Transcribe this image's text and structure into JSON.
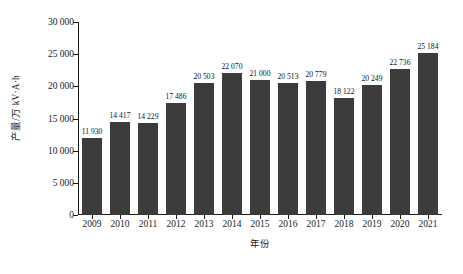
{
  "chart_data": {
    "type": "bar",
    "title": "",
    "subtitle": "",
    "xlabel": "年份",
    "ylabel": "产量/万 kV·A·h",
    "categories": [
      "2009",
      "2010",
      "2011",
      "2012",
      "2013",
      "2014",
      "2015",
      "2016",
      "2017",
      "2018",
      "2019",
      "2020",
      "2021"
    ],
    "values": [
      11930,
      14417,
      14229,
      17486,
      20503,
      22070,
      21000,
      20513,
      20779,
      18122,
      20249,
      22736,
      25184
    ],
    "value_labels": [
      "11 930",
      "14 417",
      "14 229",
      "17 486",
      "20 503",
      "22 070",
      "21 000",
      "20 513",
      "20 779",
      "18 122",
      "20 249",
      "22 736",
      "25 184"
    ],
    "ylim": [
      0,
      30000
    ],
    "ytick_values": [
      0,
      5000,
      10000,
      15000,
      20000,
      25000,
      30000
    ],
    "ytick_labels": [
      "0",
      "5 000",
      "10 000",
      "15 000",
      "20 000",
      "25 000",
      "30 000"
    ],
    "grid": false,
    "legend": null,
    "series_color": "#3b3b3b",
    "axis_color": "#1a1a1a"
  }
}
